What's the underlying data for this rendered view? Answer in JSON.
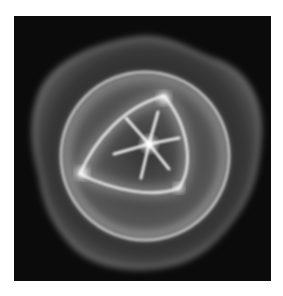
{
  "image": {
    "description": "Glowing translucent white organic shape on black background: outer lobed membrane, inner circular ring, rounded triangular core with a six-pointed star at the center",
    "colors": {
      "background": "#ffffff",
      "frame": "#0b0b0b",
      "glow": "#ffffff"
    }
  }
}
